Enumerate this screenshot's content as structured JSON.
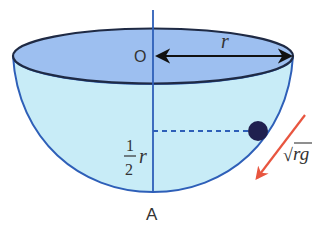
{
  "diagram": {
    "labels": {
      "center": "O",
      "radius": "r",
      "bottom": "A",
      "height_num": "1",
      "height_den": "2",
      "height_var": "r",
      "velocity_radical": "√",
      "velocity_expr": "rg"
    },
    "colors": {
      "rim_fill": "#9dbff0",
      "bowl_fill": "#c8ecf7",
      "outline": "#2e5fb8",
      "rim_outline": "#1f2a44",
      "axis": "#2e5fb8",
      "particle": "#20204f",
      "velocity_arrow": "#e8553f",
      "radius_arrow": "#111111"
    }
  }
}
